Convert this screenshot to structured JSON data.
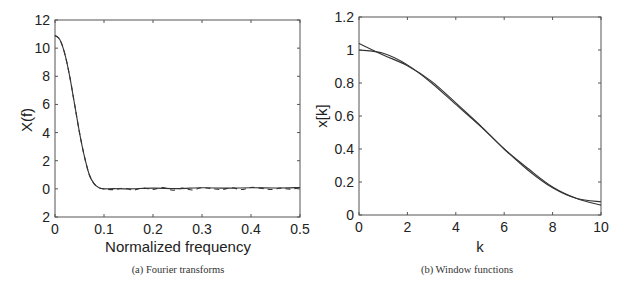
{
  "chart_data": [
    {
      "type": "line",
      "caption": "(a) Fourier transforms",
      "xlabel": "Normalized frequency",
      "ylabel": "X(f)",
      "xlim": [
        0,
        0.5
      ],
      "ylim": [
        -2,
        12
      ],
      "xticks": [
        "0",
        "0.1",
        "0.2",
        "0.3",
        "0.4",
        "0.5"
      ],
      "yticks": [
        "12",
        "10",
        "8",
        "6",
        "4",
        "2",
        "0",
        "2"
      ],
      "grid": false,
      "series": [
        {
          "name": "solid",
          "style": "solid",
          "x": [
            0,
            0.01,
            0.02,
            0.03,
            0.04,
            0.05,
            0.06,
            0.07,
            0.08,
            0.09,
            0.1,
            0.12,
            0.15,
            0.2,
            0.25,
            0.3,
            0.35,
            0.4,
            0.45,
            0.5
          ],
          "y": [
            10.9,
            10.6,
            9.6,
            8.0,
            6.0,
            4.0,
            2.3,
            1.0,
            0.35,
            0.08,
            0.0,
            0.02,
            0.0,
            0.05,
            0.02,
            0.08,
            0.05,
            0.08,
            0.06,
            0.1
          ]
        },
        {
          "name": "dashed",
          "style": "dashed",
          "x": [
            0,
            0.01,
            0.02,
            0.03,
            0.04,
            0.05,
            0.06,
            0.07,
            0.08,
            0.09,
            0.1,
            0.12,
            0.14,
            0.16,
            0.18,
            0.2,
            0.22,
            0.24,
            0.26,
            0.28,
            0.3,
            0.32,
            0.34,
            0.36,
            0.38,
            0.4,
            0.42,
            0.44,
            0.46,
            0.48,
            0.5
          ],
          "y": [
            10.9,
            10.6,
            9.6,
            8.0,
            6.0,
            4.0,
            2.3,
            1.0,
            0.35,
            0.08,
            0.0,
            -0.05,
            0.05,
            -0.08,
            0.06,
            -0.05,
            0.1,
            -0.1,
            0.05,
            -0.08,
            0.08,
            0.02,
            -0.05,
            0.08,
            -0.05,
            0.1,
            0.05,
            -0.05,
            0.05,
            -0.02,
            0.1
          ]
        }
      ]
    },
    {
      "type": "line",
      "caption": "(b) Window functions",
      "xlabel": "k",
      "ylabel": "x[k]",
      "xlim": [
        0,
        10
      ],
      "ylim": [
        0,
        1.2
      ],
      "xticks": [
        "0",
        "2",
        "4",
        "6",
        "8",
        "10"
      ],
      "yticks": [
        "1.2",
        "1",
        "0.8",
        "0.6",
        "0.4",
        "0.2",
        "0"
      ],
      "grid": false,
      "series": [
        {
          "name": "window A",
          "style": "solid",
          "x": [
            0,
            1,
            2,
            3,
            4,
            5,
            6,
            7,
            8,
            9,
            10
          ],
          "y": [
            1.04,
            0.97,
            0.905,
            0.81,
            0.68,
            0.545,
            0.4,
            0.28,
            0.17,
            0.1,
            0.06
          ]
        },
        {
          "name": "window B",
          "style": "solid",
          "x": [
            0,
            1,
            2,
            3,
            4,
            5,
            6,
            7,
            8,
            9,
            10
          ],
          "y": [
            1.0,
            0.98,
            0.91,
            0.8,
            0.67,
            0.54,
            0.4,
            0.27,
            0.165,
            0.1,
            0.08
          ]
        }
      ]
    }
  ]
}
